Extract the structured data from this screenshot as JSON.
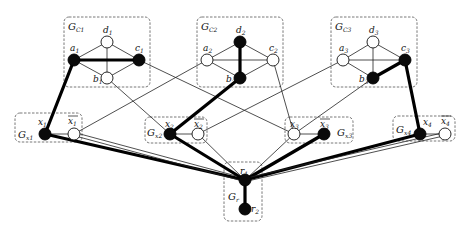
{
  "diagram": {
    "type": "graph-reduction",
    "gadgets": [
      {
        "id": "GC1",
        "label": "G",
        "sub": "C1",
        "box": [
          64,
          17,
          86,
          70
        ],
        "label_pos": [
          68,
          30
        ]
      },
      {
        "id": "GC2",
        "label": "G",
        "sub": "C2",
        "box": [
          197,
          17,
          86,
          70
        ],
        "label_pos": [
          201,
          30
        ]
      },
      {
        "id": "GC3",
        "label": "G",
        "sub": "C3",
        "box": [
          331,
          17,
          86,
          70
        ],
        "label_pos": [
          335,
          30
        ]
      },
      {
        "id": "Gx1",
        "label": "G",
        "sub": "x1",
        "box": [
          15,
          113,
          67,
          29
        ],
        "label_pos": [
          18,
          138
        ]
      },
      {
        "id": "Gx2",
        "label": "G",
        "sub": "x2",
        "box": [
          145,
          117,
          62,
          26
        ],
        "label_pos": [
          147,
          136
        ]
      },
      {
        "id": "Gx3",
        "label": "G",
        "sub": "x3",
        "box": [
          285,
          117,
          68,
          26
        ],
        "label_pos": [
          337,
          136
        ]
      },
      {
        "id": "Gx4",
        "label": "G",
        "sub": "x4",
        "box": [
          393,
          116,
          62,
          25
        ],
        "label_pos": [
          396,
          133
        ]
      },
      {
        "id": "Gr",
        "label": "G",
        "sub": "r",
        "box": [
          224,
          162,
          38,
          59
        ],
        "label_pos": [
          228,
          200
        ]
      }
    ],
    "nodes": [
      {
        "id": "a1",
        "label": "a",
        "sub": "1",
        "x": 74,
        "y": 60,
        "filled": true,
        "lx": 70,
        "ly": 51,
        "bar": false
      },
      {
        "id": "d1",
        "label": "d",
        "sub": "1",
        "x": 107,
        "y": 42,
        "filled": false,
        "lx": 103,
        "ly": 33,
        "bar": false
      },
      {
        "id": "c1",
        "label": "c",
        "sub": "1",
        "x": 139,
        "y": 60,
        "filled": true,
        "lx": 135,
        "ly": 51,
        "bar": false
      },
      {
        "id": "b1",
        "label": "b",
        "sub": "1",
        "x": 107,
        "y": 78,
        "filled": false,
        "lx": 93,
        "ly": 82,
        "bar": false
      },
      {
        "id": "a2",
        "label": "a",
        "sub": "2",
        "x": 207,
        "y": 60,
        "filled": false,
        "lx": 203,
        "ly": 51,
        "bar": false
      },
      {
        "id": "d2",
        "label": "d",
        "sub": "2",
        "x": 240,
        "y": 42,
        "filled": true,
        "lx": 236,
        "ly": 33,
        "bar": false
      },
      {
        "id": "c2",
        "label": "c",
        "sub": "2",
        "x": 273,
        "y": 60,
        "filled": false,
        "lx": 269,
        "ly": 51,
        "bar": false
      },
      {
        "id": "b2",
        "label": "b",
        "sub": "2",
        "x": 240,
        "y": 78,
        "filled": true,
        "lx": 226,
        "ly": 82,
        "bar": false
      },
      {
        "id": "a3",
        "label": "a",
        "sub": "3",
        "x": 343,
        "y": 60,
        "filled": false,
        "lx": 339,
        "ly": 51,
        "bar": false
      },
      {
        "id": "d3",
        "label": "d",
        "sub": "3",
        "x": 373,
        "y": 42,
        "filled": false,
        "lx": 369,
        "ly": 33,
        "bar": false
      },
      {
        "id": "c3",
        "label": "c",
        "sub": "3",
        "x": 405,
        "y": 60,
        "filled": true,
        "lx": 401,
        "ly": 51,
        "bar": false
      },
      {
        "id": "b3",
        "label": "b",
        "sub": "3",
        "x": 373,
        "y": 78,
        "filled": true,
        "lx": 359,
        "ly": 82,
        "bar": false
      },
      {
        "id": "x1",
        "label": "x",
        "sub": "1",
        "x": 45,
        "y": 134,
        "filled": true,
        "lx": 38,
        "ly": 125,
        "bar": false
      },
      {
        "id": "nx1",
        "label": "x",
        "sub": "1",
        "x": 74,
        "y": 134,
        "filled": false,
        "lx": 68,
        "ly": 124,
        "bar": true
      },
      {
        "id": "x2",
        "label": "x",
        "sub": "2",
        "x": 170,
        "y": 134,
        "filled": true,
        "lx": 165,
        "ly": 127,
        "bar": false
      },
      {
        "id": "nx2",
        "label": "x",
        "sub": "2",
        "x": 198,
        "y": 134,
        "filled": false,
        "lx": 194,
        "ly": 127,
        "bar": true
      },
      {
        "id": "x3",
        "label": "x",
        "sub": "3",
        "x": 294,
        "y": 134,
        "filled": false,
        "lx": 290,
        "ly": 127,
        "bar": false
      },
      {
        "id": "nx3",
        "label": "x",
        "sub": "3",
        "x": 324,
        "y": 134,
        "filled": true,
        "lx": 320,
        "ly": 127,
        "bar": true
      },
      {
        "id": "x4",
        "label": "x",
        "sub": "4",
        "x": 420,
        "y": 134,
        "filled": true,
        "lx": 423,
        "ly": 125,
        "bar": false
      },
      {
        "id": "nx4",
        "label": "x",
        "sub": "4",
        "x": 445,
        "y": 134,
        "filled": false,
        "lx": 441,
        "ly": 124,
        "bar": true
      },
      {
        "id": "r1",
        "label": "r",
        "sub": "1",
        "x": 245,
        "y": 180,
        "filled": true,
        "lx": 240,
        "ly": 174,
        "bar": false
      },
      {
        "id": "r2",
        "label": "r",
        "sub": "2",
        "x": 245,
        "y": 209,
        "filled": true,
        "lx": 251,
        "ly": 212,
        "bar": false
      }
    ],
    "edges": [
      {
        "from": "a1",
        "to": "d1",
        "bold": false
      },
      {
        "from": "d1",
        "to": "c1",
        "bold": false
      },
      {
        "from": "a1",
        "to": "b1",
        "bold": false
      },
      {
        "from": "b1",
        "to": "c1",
        "bold": false
      },
      {
        "from": "d1",
        "to": "b1",
        "bold": false
      },
      {
        "from": "a1",
        "to": "c1",
        "bold": true
      },
      {
        "from": "a2",
        "to": "d2",
        "bold": false
      },
      {
        "from": "d2",
        "to": "c2",
        "bold": false
      },
      {
        "from": "a2",
        "to": "b2",
        "bold": false
      },
      {
        "from": "b2",
        "to": "c2",
        "bold": false
      },
      {
        "from": "a2",
        "to": "c2",
        "bold": false
      },
      {
        "from": "d2",
        "to": "b2",
        "bold": true
      },
      {
        "from": "a3",
        "to": "d3",
        "bold": false
      },
      {
        "from": "d3",
        "to": "c3",
        "bold": false
      },
      {
        "from": "a3",
        "to": "b3",
        "bold": false
      },
      {
        "from": "a3",
        "to": "c3",
        "bold": false
      },
      {
        "from": "d3",
        "to": "b3",
        "bold": false
      },
      {
        "from": "b3",
        "to": "c3",
        "bold": true
      },
      {
        "from": "a1",
        "to": "x1",
        "bold": true
      },
      {
        "from": "b1",
        "to": "x2",
        "bold": false
      },
      {
        "from": "c1",
        "to": "x3",
        "bold": false
      },
      {
        "from": "a2",
        "to": "nx1",
        "bold": false
      },
      {
        "from": "b2",
        "to": "x2",
        "bold": true
      },
      {
        "from": "c2",
        "to": "x3",
        "bold": false
      },
      {
        "from": "a3",
        "to": "nx2",
        "bold": false
      },
      {
        "from": "b3",
        "to": "x3",
        "bold": false
      },
      {
        "from": "c3",
        "to": "x4",
        "bold": true
      },
      {
        "from": "x1",
        "to": "nx1",
        "bold": false
      },
      {
        "from": "x2",
        "to": "nx2",
        "bold": false
      },
      {
        "from": "x3",
        "to": "nx3",
        "bold": false
      },
      {
        "from": "x4",
        "to": "nx4",
        "bold": false
      },
      {
        "from": "x1",
        "to": "r1",
        "bold": true
      },
      {
        "from": "nx1",
        "to": "r1",
        "bold": false,
        "double": true
      },
      {
        "from": "x2",
        "to": "r1",
        "bold": true
      },
      {
        "from": "nx2",
        "to": "r1",
        "bold": false
      },
      {
        "from": "x3",
        "to": "r1",
        "bold": false
      },
      {
        "from": "nx3",
        "to": "r1",
        "bold": true
      },
      {
        "from": "x4",
        "to": "r1",
        "bold": true
      },
      {
        "from": "nx4",
        "to": "r1",
        "bold": false,
        "double": true
      },
      {
        "from": "r1",
        "to": "r2",
        "bold": true
      }
    ]
  }
}
